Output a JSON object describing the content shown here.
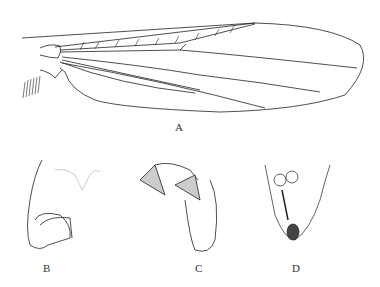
{
  "figure": {
    "panels": [
      {
        "id": "A",
        "label": "A",
        "subject": "wing"
      },
      {
        "id": "B",
        "label": "B",
        "subject": "genitalia-lateral"
      },
      {
        "id": "C",
        "label": "C",
        "subject": "genitalia-dorsal"
      },
      {
        "id": "D",
        "label": "D",
        "subject": "genitalia-female"
      }
    ],
    "colors": {
      "ink": "#222222",
      "shade": "#bbbbbb",
      "background": "#ffffff"
    }
  }
}
